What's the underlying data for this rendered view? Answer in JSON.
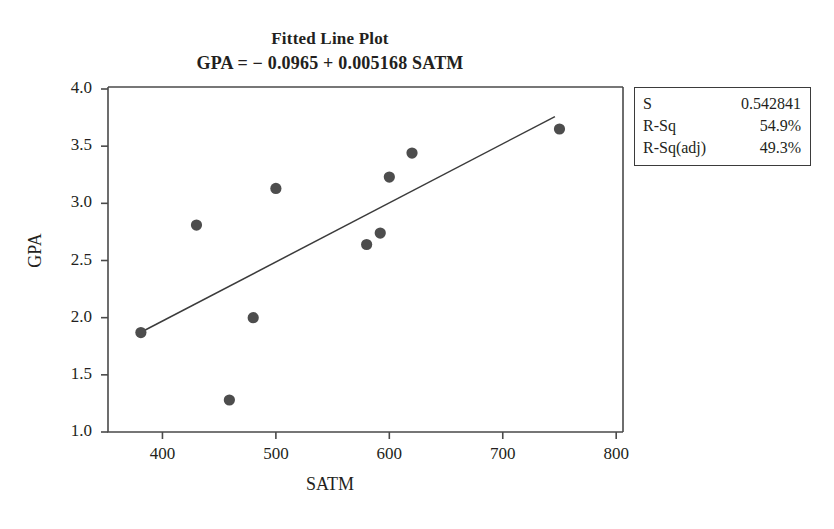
{
  "chart_data": {
    "type": "scatter",
    "title": "Fitted Line Plot",
    "subtitle": "GPA =  − 0.0965 + 0.005168 SATM",
    "xlabel": "SATM",
    "ylabel": "GPA",
    "xlim": [
      352,
      806
    ],
    "ylim": [
      1.0,
      4.0
    ],
    "xticks": [
      400,
      500,
      600,
      700,
      800
    ],
    "yticks": [
      "1.0",
      "1.5",
      "2.0",
      "2.5",
      "3.0",
      "3.5",
      "4.0"
    ],
    "xtick_values": [
      400,
      500,
      600,
      700,
      800
    ],
    "ytick_values": [
      1.0,
      1.5,
      2.0,
      2.5,
      3.0,
      3.5,
      4.0
    ],
    "grid": false,
    "legend": "none",
    "point_color": "#4d4d4d",
    "line_color": "#3b3b3b",
    "axis_color": "#4a4a4a",
    "points": [
      {
        "x": 381,
        "y": 1.87
      },
      {
        "x": 430,
        "y": 2.81
      },
      {
        "x": 459,
        "y": 1.28
      },
      {
        "x": 480,
        "y": 2.0
      },
      {
        "x": 500,
        "y": 3.13
      },
      {
        "x": 580,
        "y": 2.64
      },
      {
        "x": 592,
        "y": 2.74
      },
      {
        "x": 600,
        "y": 3.23
      },
      {
        "x": 620,
        "y": 3.44
      },
      {
        "x": 750,
        "y": 3.65
      }
    ],
    "fit_line": {
      "equation": "GPA =  − 0.0965 + 0.005168 SATM",
      "intercept": -0.0965,
      "slope": 0.005168,
      "x_start": 381,
      "x_end": 746
    }
  },
  "stats_box": {
    "rows": [
      {
        "key": "S",
        "value": "0.542841"
      },
      {
        "key": "R-Sq",
        "value": "54.9%"
      },
      {
        "key": "R-Sq(adj)",
        "value": "49.3%"
      }
    ]
  }
}
